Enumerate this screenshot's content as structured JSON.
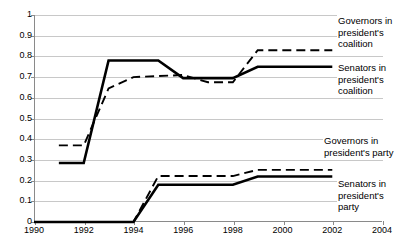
{
  "chart_data": {
    "type": "line",
    "title": "",
    "xlabel": "",
    "ylabel": "",
    "xlim": [
      1990,
      2004
    ],
    "ylim": [
      0,
      1
    ],
    "grid": true,
    "legend_position": "inline-right-annotations",
    "x_ticks": [
      "1990",
      "1992",
      "1994",
      "1996",
      "1998",
      "2000",
      "2002",
      "2004"
    ],
    "y_ticks": [
      "0",
      "0.1",
      "0.2",
      "0.3",
      "0.4",
      "0.5",
      "0.6",
      "0.7",
      "0.8",
      "0.9",
      "1"
    ],
    "series": [
      {
        "name": "Governors in president's coalition",
        "style": "dashed",
        "label_text": "Governors in\npresident's\ncoalition",
        "x": [
          1991,
          1992,
          1993,
          1994,
          1995,
          1996,
          1997,
          1998,
          1999,
          2000,
          2001,
          2002
        ],
        "values": [
          0.37,
          0.37,
          0.645,
          0.7,
          0.705,
          0.71,
          0.675,
          0.675,
          0.83,
          0.83,
          0.83,
          0.83
        ]
      },
      {
        "name": "Senators in president's coalition",
        "style": "solid",
        "label_text": "Senators in\npresident's\ncoalition",
        "x": [
          1991,
          1992,
          1993,
          1994,
          1995,
          1996,
          1997,
          1998,
          1999,
          2000,
          2001,
          2002
        ],
        "values": [
          0.285,
          0.285,
          0.78,
          0.78,
          0.78,
          0.695,
          0.695,
          0.695,
          0.75,
          0.75,
          0.75,
          0.75
        ]
      },
      {
        "name": "Governors in president's party",
        "style": "dashed",
        "label_text": "Governors in\npresident's party",
        "x": [
          1990,
          1991,
          1992,
          1993,
          1994,
          1995,
          1996,
          1997,
          1998,
          1999,
          2000,
          2001,
          2002
        ],
        "values": [
          0.0,
          0.0,
          0.0,
          0.0,
          0.0,
          0.222,
          0.222,
          0.222,
          0.222,
          0.252,
          0.252,
          0.252,
          0.252
        ]
      },
      {
        "name": "Senators in president's party",
        "style": "solid",
        "label_text": "Senators in\npresident's\nparty",
        "x": [
          1990,
          1991,
          1992,
          1993,
          1994,
          1995,
          1996,
          1997,
          1998,
          1999,
          2000,
          2001,
          2002
        ],
        "values": [
          0.0,
          0.0,
          0.0,
          0.0,
          0.0,
          0.18,
          0.18,
          0.18,
          0.18,
          0.22,
          0.22,
          0.22,
          0.22
        ]
      }
    ]
  }
}
